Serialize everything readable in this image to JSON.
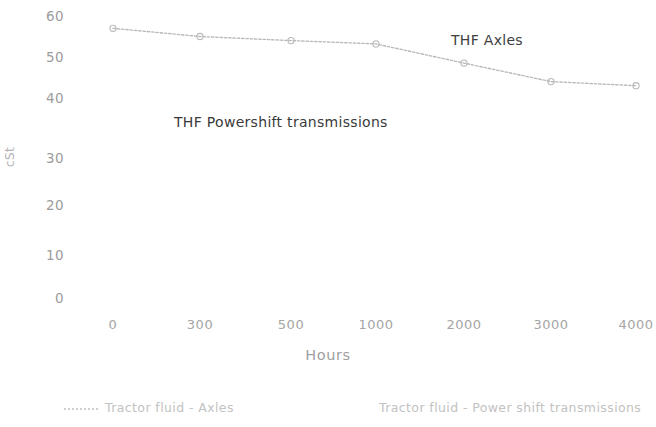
{
  "chart_data": {
    "type": "line",
    "title": "",
    "subtitle": "",
    "xlabel": "Hours",
    "ylabel": "cSt",
    "categories": [
      "0",
      "300",
      "500",
      "1000",
      "2000",
      "3000",
      "4000"
    ],
    "series": [
      {
        "name": "Tractor fluid - Axles",
        "values": [
          57,
          55,
          54,
          53.2,
          48.5,
          44,
          43
        ],
        "color": "#b9b9b9",
        "marker": "circle",
        "line_style": "dotted"
      }
    ],
    "ylim": [
      0,
      60
    ],
    "y_ticks": [
      "60",
      "50",
      "40",
      "30",
      "20",
      "10",
      "0"
    ],
    "y_tick_values": [
      60,
      50,
      40,
      30,
      20,
      10,
      0
    ],
    "grid": false,
    "legend_position": "bottom",
    "annotations": [
      {
        "text": "THF Axles",
        "x_category": "2000",
        "y_value": 56
      },
      {
        "text": "THF Powershift transmissions",
        "x_category": "500",
        "y_value": 37
      }
    ]
  },
  "axes": {
    "y_title": "cSt",
    "x_title": "Hours",
    "y_ticks": [
      {
        "label": "60",
        "value": 60
      },
      {
        "label": "50",
        "value": 50
      },
      {
        "label": "40",
        "value": 40
      },
      {
        "label": "30",
        "value": 30
      },
      {
        "label": "20",
        "value": 20
      },
      {
        "label": "10",
        "value": 10
      },
      {
        "label": "0",
        "value": 0
      }
    ],
    "x_ticks": [
      {
        "label": "0"
      },
      {
        "label": "300"
      },
      {
        "label": "500"
      },
      {
        "label": "1000"
      },
      {
        "label": "2000"
      },
      {
        "label": "3000"
      },
      {
        "label": "4000"
      }
    ]
  },
  "annotations": {
    "axles": "THF Axles",
    "powershift": "THF Powershift transmissions"
  },
  "legend": {
    "entries": [
      {
        "label": "Tractor fluid - Axles",
        "marker": "dotted-line"
      },
      {
        "label": "Tractor fluid - Power shift transmissions",
        "marker": "none"
      }
    ]
  },
  "colors": {
    "series_line": "#b9b9b9",
    "tick_text": "#a5a5a5",
    "legend_text": "#c2c2c2",
    "annotation_text": "#3e3e3e",
    "background": "#ffffff"
  }
}
